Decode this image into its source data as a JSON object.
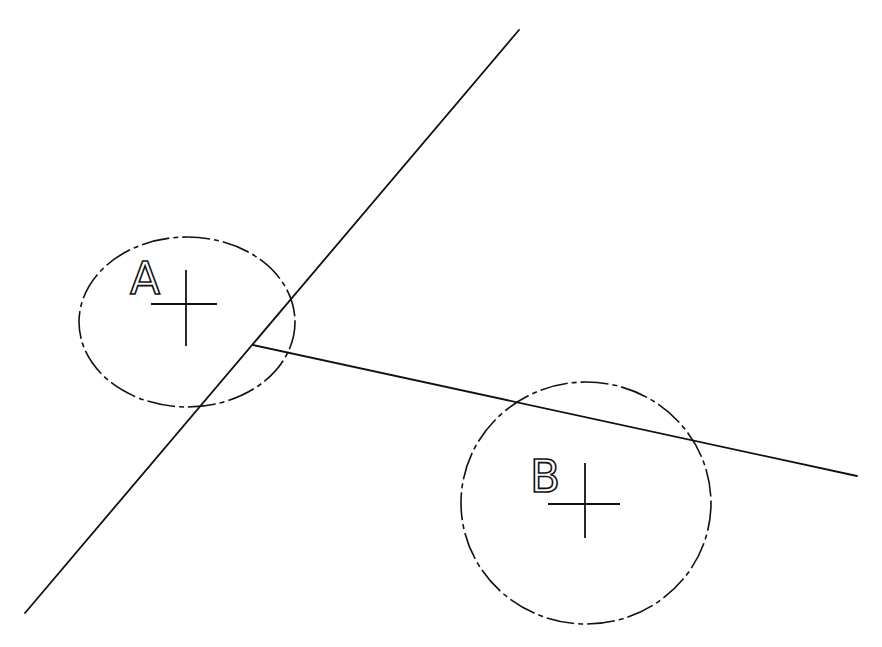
{
  "diagram": {
    "labels": {
      "a": "A",
      "b": "B"
    },
    "lines": [
      {
        "name": "line-1",
        "x1": 25,
        "y1": 613,
        "x2": 519,
        "y2": 30
      },
      {
        "name": "line-2",
        "x1": 253,
        "y1": 345,
        "x2": 857,
        "y2": 476
      }
    ],
    "circles": [
      {
        "name": "circle-a",
        "cx": 187,
        "cy": 322,
        "r": 107,
        "style": "dash-dot"
      },
      {
        "name": "circle-b",
        "cx": 586,
        "cy": 502,
        "r": 125,
        "style": "dash-dot"
      }
    ],
    "center_marks": [
      {
        "name": "center-mark-a",
        "cx": 187,
        "cy": 304
      },
      {
        "name": "center-mark-b",
        "cx": 585,
        "cy": 504
      }
    ],
    "stroke_color": "#111111",
    "background_color": "#ffffff"
  }
}
